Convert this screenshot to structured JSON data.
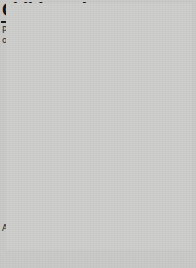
{
  "header": {
    "title": "Child smokers",
    "subtitle": "Percentage of regular smoking (at least one cigarette per week) 1996"
  },
  "axis": {
    "ages_label": "Ages",
    "y_ticks": [
      "35",
      "30",
      "25",
      "20",
      "15",
      "10",
      "5",
      "0"
    ],
    "x_ticks": [
      "11",
      "12",
      "13",
      "14",
      "15"
    ]
  },
  "series_labels": {
    "girls": "Girls",
    "boys": "Boys"
  },
  "colors": {
    "girls_line": "#1a1a1a",
    "boys_line": "#6e6e6c",
    "gridline": "#8e8e8c",
    "background": "#cdcdcb",
    "text": "#161616"
  },
  "chart_data": {
    "type": "line",
    "title": "Child smokers",
    "subtitle": "Percentage of regular smoking (at least one cigarette per week) 1996",
    "xlabel": "Ages",
    "ylabel": "",
    "x": [
      11,
      12,
      13,
      14,
      15
    ],
    "categories": [
      "11",
      "12",
      "13",
      "14",
      "15"
    ],
    "series": [
      {
        "name": "Girls",
        "values": [
          1,
          3,
          10,
          22,
          32
        ]
      },
      {
        "name": "Boys",
        "values": [
          1,
          2.5,
          7,
          11,
          27
        ]
      }
    ],
    "ylim": [
      0,
      35
    ],
    "ytick_step": 5,
    "yticks": [
      0,
      5,
      10,
      15,
      20,
      25,
      30,
      35
    ],
    "grid": true,
    "legend": "inline-annotations"
  }
}
